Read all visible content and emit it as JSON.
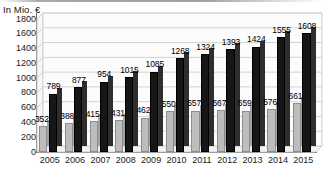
{
  "chart_data": {
    "type": "bar",
    "title": "In Mio. €",
    "xlabel": "",
    "ylabel": "",
    "ylim": [
      0,
      1800
    ],
    "ytick_step": 200,
    "yticks": [
      0,
      200,
      400,
      600,
      800,
      1000,
      1200,
      1400,
      1600,
      1800
    ],
    "categories": [
      "2005",
      "2006",
      "2007",
      "2008",
      "2009",
      "2010",
      "2011",
      "2012",
      "2013",
      "2014",
      "2015"
    ],
    "grid": "horizontal",
    "legend": "none",
    "style3d": true,
    "series": [
      {
        "name": "gray-series",
        "color": "#bdbdbd",
        "values": [
          352,
          388,
          415,
          431,
          462,
          550,
          557,
          567,
          559,
          576,
          661
        ]
      },
      {
        "name": "black-series",
        "color": "#161616",
        "values": [
          789,
          877,
          954,
          1015,
          1085,
          1268,
          1324,
          1393,
          1424,
          1555,
          1608
        ]
      }
    ]
  },
  "colors": {
    "gray_bar": "#bdbdbd",
    "gray_bar_edge": "#8d8d8d",
    "black_bar": "#161616",
    "gridline": "#d2d2d2",
    "axis": "#6f6f6f",
    "text": "#1a1a1a",
    "background": "#ffffff"
  }
}
